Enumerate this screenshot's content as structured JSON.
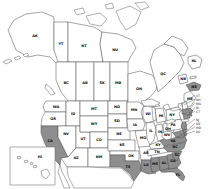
{
  "map": {
    "title": "North America state/province distribution map",
    "colors": {
      "background": "#ffffff",
      "land": "#ffffff",
      "shaded": "#8e8e8e",
      "border": "#4b4b4b",
      "label": "#0b0b0b",
      "callout_text": "#222222",
      "inset_border": "#777777"
    },
    "regions": [
      {
        "code": "AK",
        "shaded": false
      },
      {
        "code": "YT",
        "shaded": false
      },
      {
        "code": "NT",
        "shaded": false
      },
      {
        "code": "NU",
        "shaded": false
      },
      {
        "code": "BC",
        "shaded": false
      },
      {
        "code": "AB",
        "shaded": false
      },
      {
        "code": "SK",
        "shaded": false
      },
      {
        "code": "MB",
        "shaded": false
      },
      {
        "code": "ON",
        "shaded": false
      },
      {
        "code": "QC",
        "shaded": false
      },
      {
        "code": "NL",
        "shaded": false
      },
      {
        "code": "NB",
        "shaded": false
      },
      {
        "code": "PE",
        "shaded": false
      },
      {
        "code": "NS",
        "shaded": true
      },
      {
        "code": "WA",
        "shaded": false
      },
      {
        "code": "OR",
        "shaded": false
      },
      {
        "code": "CA",
        "shaded": true
      },
      {
        "code": "ID",
        "shaded": false
      },
      {
        "code": "NV",
        "shaded": false
      },
      {
        "code": "UT",
        "shaded": false
      },
      {
        "code": "AZ",
        "shaded": false
      },
      {
        "code": "MT",
        "shaded": false
      },
      {
        "code": "WY",
        "shaded": false
      },
      {
        "code": "CO",
        "shaded": false
      },
      {
        "code": "NM",
        "shaded": false
      },
      {
        "code": "ND",
        "shaded": false
      },
      {
        "code": "SD",
        "shaded": false
      },
      {
        "code": "NE",
        "shaded": false
      },
      {
        "code": "KS",
        "shaded": false
      },
      {
        "code": "OK",
        "shaded": false
      },
      {
        "code": "TX",
        "shaded": true
      },
      {
        "code": "MN",
        "shaded": false
      },
      {
        "code": "IA",
        "shaded": false
      },
      {
        "code": "MO",
        "shaded": false
      },
      {
        "code": "AR",
        "shaded": false
      },
      {
        "code": "LA",
        "shaded": true
      },
      {
        "code": "WI",
        "shaded": false
      },
      {
        "code": "IL",
        "shaded": false
      },
      {
        "code": "IN",
        "shaded": false
      },
      {
        "code": "MI",
        "shaded": false
      },
      {
        "code": "OH",
        "shaded": false
      },
      {
        "code": "KY",
        "shaded": false
      },
      {
        "code": "TN",
        "shaded": false
      },
      {
        "code": "MS",
        "shaded": true
      },
      {
        "code": "AL",
        "shaded": true
      },
      {
        "code": "GA",
        "shaded": true
      },
      {
        "code": "FL",
        "shaded": true
      },
      {
        "code": "SC",
        "shaded": true
      },
      {
        "code": "NC",
        "shaded": true
      },
      {
        "code": "VA",
        "shaded": true
      },
      {
        "code": "WV",
        "shaded": false
      },
      {
        "code": "PA",
        "shaded": false
      },
      {
        "code": "NY",
        "shaded": false
      },
      {
        "code": "ME",
        "shaded": false
      },
      {
        "code": "VT",
        "shaded": false
      },
      {
        "code": "NH",
        "shaded": false
      },
      {
        "code": "MA",
        "shaded": true
      },
      {
        "code": "RI",
        "shaded": true
      },
      {
        "code": "CT",
        "shaded": true
      },
      {
        "code": "NJ",
        "shaded": true
      },
      {
        "code": "DE",
        "shaded": true
      },
      {
        "code": "MD",
        "shaded": true
      }
    ],
    "callouts": [
      "VT",
      "NH",
      "MA",
      "RI",
      "CT",
      "NJ",
      "DE",
      "MD",
      "DC"
    ],
    "inset": {
      "label": "HI"
    }
  }
}
